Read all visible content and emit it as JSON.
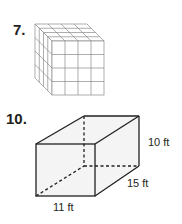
{
  "problems": [
    {
      "number": "7.",
      "figure": "cube-of-unit-cubes",
      "grid": {
        "rows": 4,
        "cols": 4,
        "depth": 4
      },
      "colors": {
        "edge": "#8a8a8a",
        "face": "#ffffff"
      }
    },
    {
      "number": "10.",
      "figure": "rectangular-prism",
      "labels": {
        "height": "10 ft",
        "depth": "15 ft",
        "width": "11 ft"
      },
      "colors": {
        "edge": "#231f20",
        "face": "#f2f2f2"
      }
    }
  ]
}
